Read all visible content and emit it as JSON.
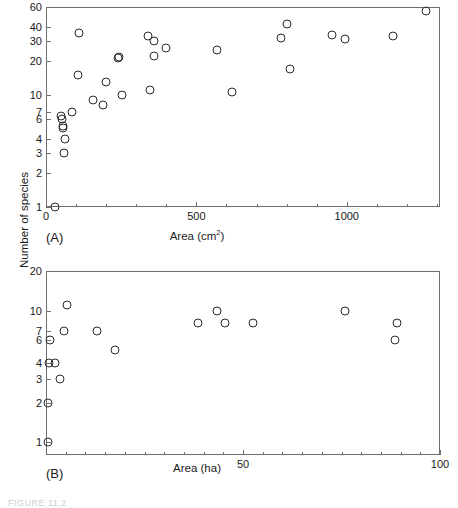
{
  "figure": {
    "shared_ylabel": "Number of species",
    "caption_fragment": "FIGURE 11.2"
  },
  "chart_data": [
    {
      "id": "panel-a",
      "type": "scatter",
      "title": "",
      "panel_label": "(A)",
      "xlabel": "Area (cm",
      "xlabel_sup": "2",
      "xlabel_suffix": ")",
      "ylabel": "Number of species",
      "xscale": "linear",
      "yscale": "log",
      "xlim": [
        0,
        1310
      ],
      "ylim": [
        1,
        60
      ],
      "grid": false,
      "legend": false,
      "xticks": [
        0,
        500,
        1000
      ],
      "xticklabels": [
        "0",
        "500",
        "1000"
      ],
      "xminorticks": [
        100,
        200,
        300,
        400,
        600,
        700,
        800,
        900,
        1100,
        1200,
        1300
      ],
      "yticks": [
        1,
        2,
        3,
        4,
        6,
        7,
        10,
        20,
        30,
        40,
        60
      ],
      "yticklabels": [
        "1",
        "2",
        "3",
        "4",
        "6",
        "7",
        "10",
        "20",
        "30",
        "40",
        "60"
      ],
      "marker": "open-circle",
      "points": [
        {
          "x": 30,
          "y": 1
        },
        {
          "x": 60,
          "y": 3
        },
        {
          "x": 62,
          "y": 4
        },
        {
          "x": 55,
          "y": 5
        },
        {
          "x": 58,
          "y": 5.3
        },
        {
          "x": 52,
          "y": 6
        },
        {
          "x": 50,
          "y": 6.4
        },
        {
          "x": 88,
          "y": 7
        },
        {
          "x": 110,
          "y": 35
        },
        {
          "x": 105,
          "y": 15
        },
        {
          "x": 155,
          "y": 9
        },
        {
          "x": 200,
          "y": 13
        },
        {
          "x": 188,
          "y": 8
        },
        {
          "x": 238,
          "y": 21
        },
        {
          "x": 243,
          "y": 21.5
        },
        {
          "x": 252,
          "y": 10
        },
        {
          "x": 340,
          "y": 33
        },
        {
          "x": 345,
          "y": 11
        },
        {
          "x": 360,
          "y": 30
        },
        {
          "x": 358,
          "y": 22
        },
        {
          "x": 400,
          "y": 26
        },
        {
          "x": 570,
          "y": 25
        },
        {
          "x": 620,
          "y": 10.5
        },
        {
          "x": 780,
          "y": 32
        },
        {
          "x": 800,
          "y": 42
        },
        {
          "x": 810,
          "y": 17
        },
        {
          "x": 950,
          "y": 34
        },
        {
          "x": 995,
          "y": 31
        },
        {
          "x": 1155,
          "y": 33
        },
        {
          "x": 1265,
          "y": 55
        }
      ]
    },
    {
      "id": "panel-b",
      "type": "scatter",
      "title": "",
      "panel_label": "(B)",
      "xlabel": "Area (ha)",
      "ylabel": "Number of species",
      "xscale": "linear",
      "yscale": "log",
      "xlim": [
        0,
        100
      ],
      "ylim": [
        0.8,
        20
      ],
      "grid": false,
      "legend": false,
      "xticks": [
        50,
        100
      ],
      "xticklabels": [
        "50",
        "100"
      ],
      "xminorticks": [
        5,
        10,
        15,
        20,
        25,
        30,
        35,
        40,
        45,
        55,
        60,
        65,
        70,
        75,
        80,
        85,
        90,
        95
      ],
      "yticks": [
        1,
        2,
        3,
        4,
        6,
        7,
        10,
        20
      ],
      "yticklabels": [
        "1",
        "2",
        "3",
        "4",
        "6",
        "7",
        "10",
        "20"
      ],
      "marker": "open-circle",
      "points": [
        {
          "x": 0.6,
          "y": 1
        },
        {
          "x": 0.6,
          "y": 2
        },
        {
          "x": 0.8,
          "y": 4
        },
        {
          "x": 2.4,
          "y": 4
        },
        {
          "x": 1.0,
          "y": 6
        },
        {
          "x": 3.6,
          "y": 3
        },
        {
          "x": 4.6,
          "y": 7
        },
        {
          "x": 5.4,
          "y": 11
        },
        {
          "x": 13.0,
          "y": 7
        },
        {
          "x": 17.5,
          "y": 5
        },
        {
          "x": 38.5,
          "y": 8
        },
        {
          "x": 43.5,
          "y": 10
        },
        {
          "x": 45.5,
          "y": 8
        },
        {
          "x": 52.5,
          "y": 8
        },
        {
          "x": 76.0,
          "y": 10
        },
        {
          "x": 89.0,
          "y": 8
        },
        {
          "x": 88.5,
          "y": 6
        }
      ]
    }
  ]
}
